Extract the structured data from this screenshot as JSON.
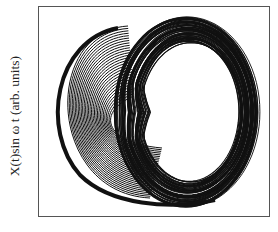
{
  "chart_data": {
    "type": "line",
    "subtype": "phase-portrait",
    "title": "",
    "xlabel": "",
    "ylabel": "X(t)sin ω t (arb. units)",
    "grid": false,
    "legend": null,
    "ring": {
      "cx": 190,
      "cy": 112,
      "outer_rx": 72,
      "outer_ry": 95,
      "inner_rx": 50,
      "inner_ry": 70,
      "strokes": 60
    },
    "fan": {
      "count": 30,
      "x_left": 52,
      "x_right": 135
    },
    "stroke_color": "#111111"
  },
  "axes": {
    "ylabel": "X(t)sin ω t (arb. units)"
  }
}
